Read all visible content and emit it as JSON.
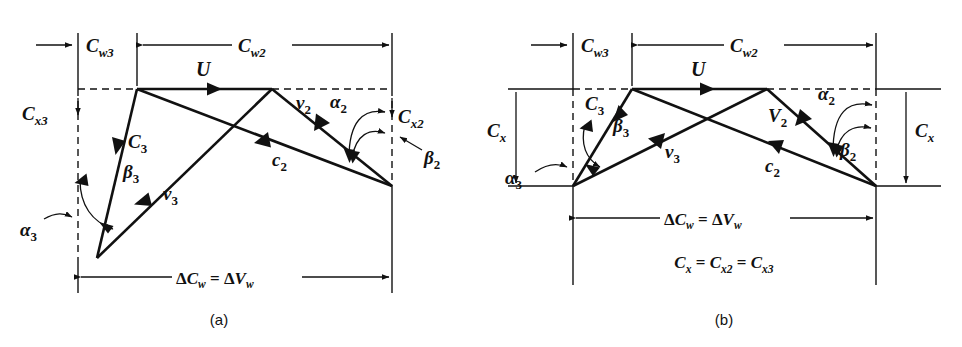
{
  "figure": {
    "background_color": "#ffffff",
    "line_color": "#111111"
  },
  "panels": [
    {
      "id": "a",
      "caption": "(a)",
      "dimensions": {
        "top_left": {
          "symbol": "C",
          "sub": "w3",
          "text": "Cw3"
        },
        "top_right": {
          "symbol": "C",
          "sub": "w2",
          "text": "Cw2"
        },
        "left_vertical": {
          "symbol": "C",
          "sub": "x3",
          "text": "Cx3"
        },
        "right_vertical": {
          "symbol": "C",
          "sub": "x2",
          "text": "Cx2"
        },
        "bottom": {
          "lhs_symbol": "C",
          "lhs_sub": "w",
          "rhs_symbol": "V",
          "rhs_sub": "w",
          "text": "ΔCw = ΔVw"
        }
      },
      "vectors": [
        {
          "name": "U",
          "label": "U",
          "case": "upper"
        },
        {
          "name": "C3",
          "label": "C",
          "sub": "3",
          "case": "upper"
        },
        {
          "name": "v3",
          "label": "v",
          "sub": "3",
          "case": "lower"
        },
        {
          "name": "c2",
          "label": "c",
          "sub": "2",
          "case": "lower"
        },
        {
          "name": "v2",
          "label": "v",
          "sub": "2",
          "case": "lower"
        }
      ],
      "angles": [
        {
          "name": "alpha3",
          "glyph": "α",
          "sub": "3"
        },
        {
          "name": "beta3",
          "glyph": "β",
          "sub": "3"
        },
        {
          "name": "alpha2",
          "glyph": "α",
          "sub": "2"
        },
        {
          "name": "beta2",
          "glyph": "β",
          "sub": "2"
        }
      ]
    },
    {
      "id": "b",
      "caption": "(b)",
      "dimensions": {
        "top_left": {
          "symbol": "C",
          "sub": "w3",
          "text": "Cw3"
        },
        "top_right": {
          "symbol": "C",
          "sub": "w2",
          "text": "Cw2"
        },
        "left_vertical": {
          "symbol": "C",
          "sub": "x",
          "text": "Cx"
        },
        "right_vertical": {
          "symbol": "C",
          "sub": "x",
          "text": "Cx"
        },
        "bottom": {
          "lhs_symbol": "C",
          "lhs_sub": "w",
          "rhs_symbol": "V",
          "rhs_sub": "w",
          "text": "ΔCw = ΔVw"
        }
      },
      "note_equation": {
        "terms": [
          "Cx",
          "Cx2",
          "Cx3"
        ],
        "text": "Cx = Cx2 = Cx3"
      },
      "vectors": [
        {
          "name": "U",
          "label": "U",
          "case": "upper"
        },
        {
          "name": "C3",
          "label": "C",
          "sub": "3",
          "case": "upper"
        },
        {
          "name": "v3",
          "label": "v",
          "sub": "3",
          "case": "lower"
        },
        {
          "name": "c2",
          "label": "c",
          "sub": "2",
          "case": "lower"
        },
        {
          "name": "V2",
          "label": "V",
          "sub": "2",
          "case": "upper"
        }
      ],
      "angles": [
        {
          "name": "alpha3",
          "glyph": "α",
          "sub": "3"
        },
        {
          "name": "beta3",
          "glyph": "β",
          "sub": "3"
        },
        {
          "name": "alpha2",
          "glyph": "α",
          "sub": "2"
        },
        {
          "name": "beta2",
          "glyph": "β",
          "sub": "2"
        }
      ]
    }
  ],
  "glyphs": {
    "delta": "Δ",
    "alpha": "α",
    "beta": "β",
    "equals": "="
  }
}
